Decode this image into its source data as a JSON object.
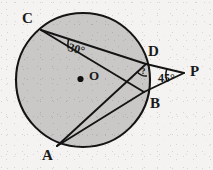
{
  "figure": {
    "canvas": {
      "width": 213,
      "height": 170
    },
    "background_color": "#f4f3f1",
    "stroke_color": "#141414",
    "circle": {
      "name": "circle-O",
      "center": {
        "x": 83,
        "y": 80
      },
      "radius": 67,
      "fill_color": "#c9c8c6",
      "stroke_width": 2.1
    },
    "center_dot": {
      "x": 80.5,
      "y": 79,
      "r": 3.1,
      "color": "#111111"
    },
    "points": [
      {
        "id": "C",
        "label": "C",
        "x": 41,
        "y": 30,
        "label_x": 22,
        "label_y": 11
      },
      {
        "id": "D",
        "label": "D",
        "x": 146,
        "y": 64,
        "label_x": 148,
        "label_y": 44
      },
      {
        "id": "B",
        "label": "B",
        "x": 144,
        "y": 92,
        "label_x": 150,
        "label_y": 96
      },
      {
        "id": "A",
        "label": "A",
        "x": 57,
        "y": 146,
        "label_x": 42,
        "label_y": 148
      },
      {
        "id": "P",
        "label": "P",
        "x": 184,
        "y": 73,
        "label_x": 190,
        "label_y": 64
      },
      {
        "id": "O",
        "label": "O",
        "x": 83,
        "y": 80,
        "label_x": 89,
        "label_y": 69
      }
    ],
    "segments": [
      {
        "name": "segment-CD",
        "from": "C",
        "to": "D"
      },
      {
        "name": "segment-CB",
        "from": "C",
        "to": "B"
      },
      {
        "name": "segment-AD",
        "from": "A",
        "to": "D"
      },
      {
        "name": "segment-AB",
        "from": "A",
        "to": "B"
      },
      {
        "name": "segment-DP",
        "from": "D",
        "to": "P"
      },
      {
        "name": "segment-BP",
        "from": "B",
        "to": "P"
      }
    ],
    "angles": [
      {
        "name": "angle-at-C",
        "vertex": "C",
        "value": "30",
        "label": "30°",
        "label_x": 70,
        "label_y": 41,
        "between": [
          "CD",
          "CB"
        ]
      },
      {
        "name": "angle-at-D-unknown",
        "vertex": "D",
        "value": "?",
        "label": "?",
        "label_x": 141,
        "label_y": 67,
        "between": [
          "DA",
          "DP"
        ]
      },
      {
        "name": "angle-at-P",
        "vertex": "P",
        "value": "45",
        "label": "45°",
        "label_x": 158,
        "label_y": 72,
        "between": [
          "PD",
          "PB"
        ]
      }
    ]
  }
}
